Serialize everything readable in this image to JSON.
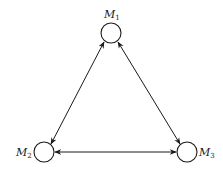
{
  "diagram": {
    "type": "graph",
    "colors": {
      "stroke": "#1a1a1a",
      "background": "#ffffff"
    },
    "nodes": [
      {
        "id": "M1",
        "label": "M",
        "subscript": "1"
      },
      {
        "id": "M2",
        "label": "M",
        "subscript": "2"
      },
      {
        "id": "M3",
        "label": "M",
        "subscript": "3"
      }
    ],
    "edges": [
      {
        "from": "M1",
        "to": "M2",
        "direction": "bidirectional"
      },
      {
        "from": "M1",
        "to": "M3",
        "direction": "bidirectional"
      },
      {
        "from": "M2",
        "to": "M3",
        "direction": "bidirectional"
      }
    ]
  }
}
